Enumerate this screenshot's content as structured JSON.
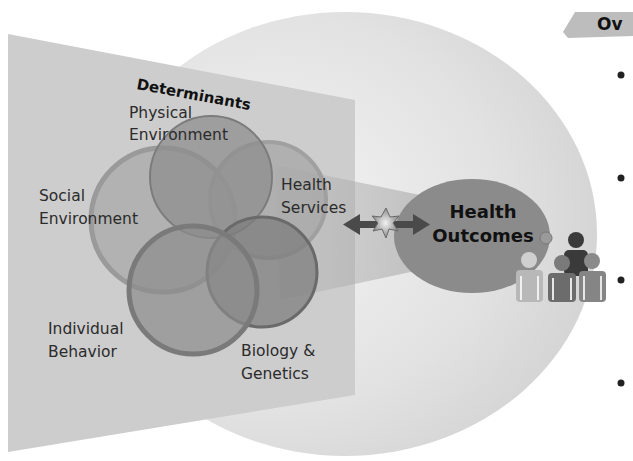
{
  "diagram": {
    "panel_title": "Determinants",
    "determinants": [
      {
        "id": "physical",
        "line1": "Physical",
        "line2": "Environment"
      },
      {
        "id": "social",
        "line1": "Social",
        "line2": "Environment"
      },
      {
        "id": "health-services",
        "line1": "Health",
        "line2": "Services"
      },
      {
        "id": "individual",
        "line1": "Individual",
        "line2": "Behavior"
      },
      {
        "id": "biology",
        "line1": "Biology &",
        "line2": "Genetics"
      }
    ],
    "outcomes": {
      "line1": "Health",
      "line2": "Outcomes"
    },
    "connector": {
      "type": "double-arrow",
      "icon": "star-burst-icon"
    },
    "population_icon": "people-group-icon"
  },
  "sidebar": {
    "tab_label": "Ov",
    "bullets": [
      "•",
      "•",
      "•",
      "•"
    ]
  },
  "colors": {
    "panel": "#cfcfcf",
    "halo": "#e4e4e4",
    "circle_fill": "#8f8f8f",
    "outcomes_fill": "#8a8a8a",
    "arrow": "#4a4a4a",
    "text": "#2b2b2b"
  }
}
